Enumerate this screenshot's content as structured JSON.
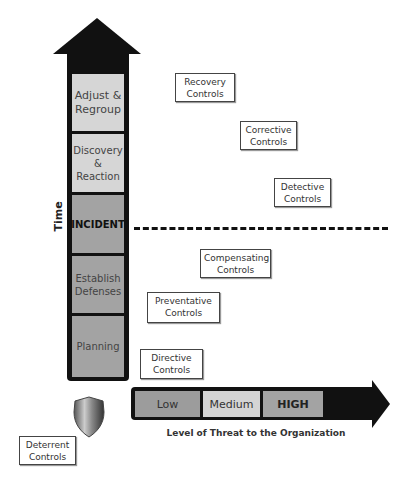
{
  "diagram": {
    "y_axis_label": "Time",
    "x_axis_label": "Level of Threat to the Organization",
    "phases": [
      {
        "label": "Adjust & Regroup"
      },
      {
        "label": "Discovery & Reaction"
      },
      {
        "label": "INCIDENT"
      },
      {
        "label": "Establish Defenses"
      },
      {
        "label": "Planning"
      }
    ],
    "threat_levels": [
      {
        "label": "Low"
      },
      {
        "label": "Medium"
      },
      {
        "label": "HIGH"
      }
    ],
    "controls": [
      {
        "label": "Recovery Controls"
      },
      {
        "label": "Corrective Controls"
      },
      {
        "label": "Detective Controls"
      },
      {
        "label": "Compensating Controls"
      },
      {
        "label": "Preventative Controls"
      },
      {
        "label": "Directive Controls"
      },
      {
        "label": "Deterrent Controls"
      }
    ],
    "icons": {
      "shield": "shield-icon"
    },
    "colors": {
      "arrow": "#111111",
      "light_box": "#d6d6d6",
      "dark_box": "#a3a3a3"
    }
  }
}
